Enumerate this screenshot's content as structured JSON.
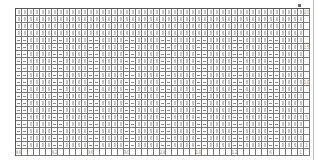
{
  "chart_title": "",
  "symbols": {
    "knit": "vertical-bar",
    "purl": "horizontal-dash"
  },
  "colors": {
    "grid_line": "#555555",
    "symbol": "#888888",
    "label": "#999999",
    "background": "#ffffff"
  },
  "grid": {
    "columns": 48,
    "rows": 20,
    "plain_rows_top": 4,
    "rib_repeat": [
      "purl",
      "purl",
      "knit",
      "knit",
      "knit",
      "knit"
    ]
  },
  "column_labels": [
    {
      "col": 0,
      "text": "48"
    },
    {
      "col": 6,
      "text": "42"
    },
    {
      "col": 12,
      "text": "36"
    },
    {
      "col": 18,
      "text": "30"
    },
    {
      "col": 24,
      "text": "24"
    },
    {
      "col": 30,
      "text": "18"
    },
    {
      "col": 36,
      "text": "12"
    },
    {
      "col": 42,
      "text": "6"
    },
    {
      "col": 47,
      "text": "1"
    }
  ],
  "row_labels": [
    {
      "row": 0,
      "text": "20"
    },
    {
      "row": 5,
      "text": "15"
    },
    {
      "row": 10,
      "text": "10"
    },
    {
      "row": 15,
      "text": "5"
    },
    {
      "row": 19,
      "text": "1"
    }
  ]
}
